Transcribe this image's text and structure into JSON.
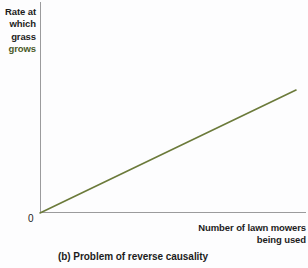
{
  "figure": {
    "caption": "(b) Problem of reverse causality",
    "y_axis_label_lines": [
      "Rate at",
      "which",
      "grass",
      "grows"
    ],
    "x_axis_label_lines": [
      "Number of lawn mowers",
      "being used"
    ],
    "origin_label": "0"
  },
  "colors": {
    "line": "#6b7a3a",
    "axis": "#9b9b9d",
    "text": "#1c1c1c",
    "background": "#fdfdfe"
  },
  "chart_data": {
    "type": "line",
    "title": "(b) Problem of reverse causality",
    "xlabel": "Number of lawn mowers being used",
    "ylabel": "Rate at which grass grows",
    "grid": false,
    "legend": false,
    "xlim": [
      0,
      100
    ],
    "ylim": [
      0,
      100
    ],
    "tick_labels": {
      "x": [],
      "y": [],
      "origin": "0"
    },
    "series": [
      {
        "name": "Rate at which grass grows vs. number of lawn mowers being used",
        "color": "#6b7a3a",
        "style": "solid-straight-line",
        "x": [
          0,
          100
        ],
        "y": [
          0,
          58
        ],
        "points": [
          {
            "x": 0,
            "y": 0
          },
          {
            "x": 25,
            "y": 14.5
          },
          {
            "x": 50,
            "y": 29
          },
          {
            "x": 75,
            "y": 43.5
          },
          {
            "x": 100,
            "y": 58
          }
        ]
      }
    ],
    "annotations": []
  }
}
